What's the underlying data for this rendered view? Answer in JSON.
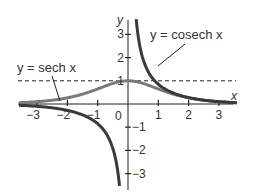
{
  "chart_data": {
    "type": "line",
    "title": "",
    "xlabel": "x",
    "ylabel": "y",
    "xlim": [
      -3.6,
      3.6
    ],
    "ylim": [
      -3.5,
      3.6
    ],
    "x_ticks": [
      -3,
      -2,
      -1,
      0,
      1,
      2,
      3
    ],
    "x_tick_labels": [
      "−3",
      "−2",
      "−1",
      "0",
      "1",
      "2",
      "3"
    ],
    "y_ticks": [
      -3,
      -2,
      -1,
      1,
      2,
      3
    ],
    "y_tick_labels": [
      "−3",
      "−2",
      "−1",
      "1",
      "2",
      "3"
    ],
    "grid": false,
    "series": [
      {
        "name": "y = sech x",
        "function": "sech",
        "color": "#7a7a7a"
      },
      {
        "name": "y = cosech x",
        "function": "cosech",
        "color": "#3a3a3a"
      }
    ],
    "asymptote": {
      "y": 1,
      "style": "dashed"
    },
    "annotations": [
      {
        "text": "y = sech x",
        "points_to": "sech"
      },
      {
        "text": "y = cosech x",
        "points_to": "cosech"
      }
    ]
  },
  "labels": {
    "sech": "y = sech x",
    "cosech": "y = cosech x",
    "x_axis": "x",
    "y_axis": "y",
    "origin": "0"
  }
}
